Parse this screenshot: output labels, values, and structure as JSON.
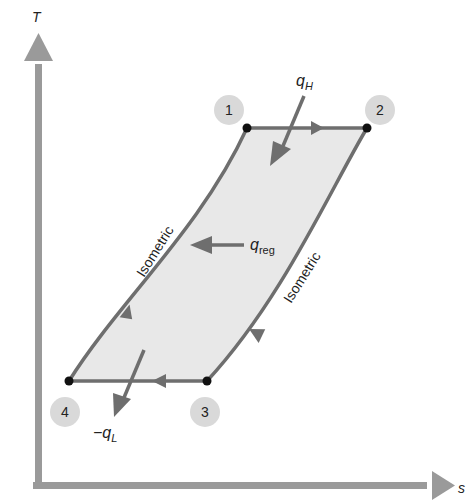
{
  "diagram": {
    "axes": {
      "y_label": "T",
      "x_label": "s"
    },
    "states": [
      {
        "id": "1",
        "label": "1"
      },
      {
        "id": "2",
        "label": "2"
      },
      {
        "id": "3",
        "label": "3"
      },
      {
        "id": "4",
        "label": "4"
      }
    ],
    "process_labels": {
      "left": "Isometric",
      "right": "Isometric"
    },
    "heat": {
      "q_high": {
        "symbol": "q",
        "sub": "H"
      },
      "q_reg": {
        "symbol": "q",
        "sub": "reg"
      },
      "q_low": {
        "symbol": "−q",
        "sub": "L"
      }
    },
    "colors": {
      "axis": "#9a9a9a",
      "line": "#6e6e6e",
      "fill": "#e8e8e8",
      "circle": "#d9d9d9",
      "point": "#111111",
      "arrow": "#6e6e6e"
    }
  }
}
